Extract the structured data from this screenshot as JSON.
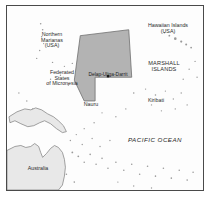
{
  "map": {
    "title": "Marshall Islands locator map",
    "ocean_label": "PACIFIC OCEAN",
    "colors": {
      "highlight_fill": "#b3b3b3",
      "highlight_stroke": "#6e6e6e",
      "land_fill": "#e8e8e8",
      "land_stroke": "#7a7a7a",
      "frame_stroke": "#4a4a4a",
      "background": "#fdfdfd",
      "text": "#2b2b2b"
    },
    "labels": [
      {
        "id": "northern-marianas",
        "text": "Northern\nMarianas\n(USA)",
        "x": 22,
        "y": 26,
        "width": 46,
        "style": "country"
      },
      {
        "id": "hawaiian-islands",
        "text": "Hawaiian Islands\n(USA)",
        "x": 130,
        "y": 17,
        "width": 62,
        "style": "country"
      },
      {
        "id": "federated-states-micronesia",
        "text": "Federated\nStates\nof Micronesia",
        "x": 28,
        "y": 64,
        "width": 54,
        "style": "country"
      },
      {
        "id": "marshall-islands",
        "text": "MARSHALL\nISLANDS",
        "x": 134,
        "y": 54,
        "width": 46,
        "style": "caps"
      },
      {
        "id": "delap-uliga-darrit",
        "text": "Delap-Uliga-Darrit",
        "x": 72,
        "y": 66,
        "width": 58,
        "style": "city"
      },
      {
        "id": "nauru",
        "text": "Nauru",
        "x": 70,
        "y": 96,
        "width": 28,
        "style": "country"
      },
      {
        "id": "kiribati",
        "text": "Kiribati",
        "x": 134,
        "y": 92,
        "width": 30,
        "style": "country"
      },
      {
        "id": "pacific-ocean",
        "text": "PACIFIC OCEAN",
        "x": 112,
        "y": 131,
        "width": 72,
        "style": "ocean"
      },
      {
        "id": "australia",
        "text": "Australia",
        "x": 12,
        "y": 160,
        "width": 38,
        "style": "country"
      }
    ],
    "highlight_region": {
      "name": "marshall-islands-territory",
      "points": "74,30 123,24 126,72 89,72 89,96 78,96 68,75"
    },
    "capital_marker": {
      "name": "delap-uliga-darrit-marker",
      "x": 102,
      "y": 71
    },
    "landmasses": [
      {
        "id": "new-guinea",
        "points": "2,112 10,107 18,104 24,105 29,103 35,105 41,109 47,112 52,116 57,121 60,127 56,128 50,124 44,119 38,116 33,118 27,121 21,122 14,119 8,116 3,118"
      },
      {
        "id": "australia",
        "points": "0,146 8,142 14,141 19,143 24,142 28,139 32,142 34,148 36,153 40,149 44,144 48,141 52,143 56,148 58,155 59,163 58,172 56,181 52,186 0,186"
      }
    ],
    "island_dots": [
      {
        "x": 170,
        "y": 33,
        "r": 1.3
      },
      {
        "x": 176,
        "y": 36,
        "r": 1.1
      },
      {
        "x": 181,
        "y": 39,
        "r": 1.0
      },
      {
        "x": 186,
        "y": 42,
        "r": 0.9
      },
      {
        "x": 164,
        "y": 30,
        "r": 0.9
      },
      {
        "x": 159,
        "y": 27,
        "r": 0.8
      },
      {
        "x": 34,
        "y": 18,
        "r": 0.8
      },
      {
        "x": 36,
        "y": 24,
        "r": 0.8
      },
      {
        "x": 35,
        "y": 31,
        "r": 0.8
      },
      {
        "x": 37,
        "y": 38,
        "r": 0.7
      },
      {
        "x": 33,
        "y": 45,
        "r": 0.7
      },
      {
        "x": 30,
        "y": 53,
        "r": 0.7
      },
      {
        "x": 46,
        "y": 57,
        "r": 0.7
      },
      {
        "x": 58,
        "y": 61,
        "r": 0.7
      },
      {
        "x": 66,
        "y": 58,
        "r": 0.7
      },
      {
        "x": 54,
        "y": 70,
        "r": 0.7
      },
      {
        "x": 44,
        "y": 74,
        "r": 0.7
      },
      {
        "x": 62,
        "y": 80,
        "r": 0.7
      },
      {
        "x": 84,
        "y": 90,
        "r": 1.2
      },
      {
        "x": 128,
        "y": 88,
        "r": 0.8
      },
      {
        "x": 140,
        "y": 84,
        "r": 0.7
      },
      {
        "x": 150,
        "y": 90,
        "r": 0.8
      },
      {
        "x": 160,
        "y": 86,
        "r": 0.7
      },
      {
        "x": 168,
        "y": 94,
        "r": 0.7
      },
      {
        "x": 176,
        "y": 88,
        "r": 0.7
      },
      {
        "x": 146,
        "y": 100,
        "r": 0.7
      },
      {
        "x": 156,
        "y": 106,
        "r": 0.7
      },
      {
        "x": 170,
        "y": 104,
        "r": 0.7
      },
      {
        "x": 182,
        "y": 100,
        "r": 0.7
      },
      {
        "x": 120,
        "y": 104,
        "r": 0.7
      },
      {
        "x": 110,
        "y": 112,
        "r": 0.7
      },
      {
        "x": 96,
        "y": 108,
        "r": 0.7
      },
      {
        "x": 88,
        "y": 118,
        "r": 0.7
      },
      {
        "x": 78,
        "y": 124,
        "r": 0.7
      },
      {
        "x": 70,
        "y": 130,
        "r": 0.7
      },
      {
        "x": 64,
        "y": 136,
        "r": 0.7
      },
      {
        "x": 76,
        "y": 140,
        "r": 0.7
      },
      {
        "x": 86,
        "y": 134,
        "r": 0.7
      },
      {
        "x": 94,
        "y": 142,
        "r": 0.7
      },
      {
        "x": 104,
        "y": 136,
        "r": 0.7
      },
      {
        "x": 66,
        "y": 148,
        "r": 0.9
      },
      {
        "x": 72,
        "y": 152,
        "r": 0.9
      },
      {
        "x": 78,
        "y": 158,
        "r": 0.8
      },
      {
        "x": 84,
        "y": 150,
        "r": 0.8
      },
      {
        "x": 90,
        "y": 160,
        "r": 0.8
      },
      {
        "x": 96,
        "y": 154,
        "r": 0.8
      },
      {
        "x": 102,
        "y": 164,
        "r": 0.8
      },
      {
        "x": 110,
        "y": 158,
        "r": 0.8
      },
      {
        "x": 118,
        "y": 166,
        "r": 0.8
      },
      {
        "x": 126,
        "y": 160,
        "r": 0.8
      },
      {
        "x": 134,
        "y": 170,
        "r": 0.8
      },
      {
        "x": 142,
        "y": 162,
        "r": 0.8
      },
      {
        "x": 150,
        "y": 172,
        "r": 0.8
      },
      {
        "x": 158,
        "y": 164,
        "r": 0.8
      },
      {
        "x": 166,
        "y": 174,
        "r": 0.8
      },
      {
        "x": 174,
        "y": 166,
        "r": 0.8
      },
      {
        "x": 182,
        "y": 176,
        "r": 0.8
      },
      {
        "x": 188,
        "y": 168,
        "r": 0.8
      },
      {
        "x": 60,
        "y": 170,
        "r": 0.8
      },
      {
        "x": 68,
        "y": 178,
        "r": 0.8
      },
      {
        "x": 112,
        "y": 178,
        "r": 0.7
      },
      {
        "x": 128,
        "y": 182,
        "r": 0.7
      },
      {
        "x": 146,
        "y": 184,
        "r": 0.7
      },
      {
        "x": 190,
        "y": 56,
        "r": 0.7
      },
      {
        "x": 184,
        "y": 64,
        "r": 0.7
      },
      {
        "x": 192,
        "y": 72,
        "r": 0.7
      },
      {
        "x": 178,
        "y": 74,
        "r": 0.7
      },
      {
        "x": 20,
        "y": 96,
        "r": 0.7
      },
      {
        "x": 12,
        "y": 88,
        "r": 0.7
      },
      {
        "x": 26,
        "y": 104,
        "r": 0.7
      }
    ]
  }
}
